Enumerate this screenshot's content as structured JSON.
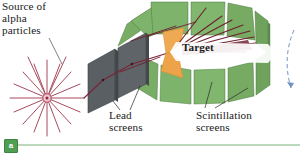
{
  "figure": {
    "panel_badge": "a"
  },
  "labels": {
    "source": "Source of\nalpha\nparticles",
    "lead_screens": "Lead\nscreens",
    "scintillation_screens": "Scintillation\nscreens",
    "target": "Target"
  },
  "colors": {
    "background": "#ffffff",
    "scintillation_green": "#7db36a",
    "scintillation_green_dark": "#62954f",
    "scintillation_edge": "#4a7a3c",
    "lead_gray": "#5a5f63",
    "lead_gray_dark": "#44484b",
    "target_orange": "#f0a953",
    "target_orange_dark": "#dd8f33",
    "alpha_ray": "#a84a5e",
    "scatter_track": "#6e1f2e",
    "beam_line": "#7a2436",
    "text": "#1b1b1b",
    "badge_green": "#4f9e52",
    "rule_green": "#bcd9bc",
    "dashed_blue": "#6f93c4"
  },
  "geometry": {
    "source_center": [
      47,
      98
    ],
    "source_ray_count": 18,
    "lead_screen_count": 2,
    "scintillation_panel_count": 9,
    "target_position": [
      172,
      52
    ],
    "scatter_track_count": 9
  }
}
